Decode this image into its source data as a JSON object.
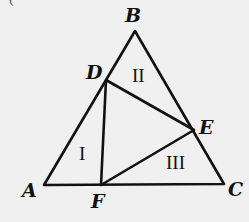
{
  "figure": {
    "partial_label": "(",
    "colors": {
      "background": "#f0f0f0",
      "stroke": "#111111"
    },
    "outer_triangle": {
      "vertices": [
        "A",
        "B",
        "C"
      ]
    },
    "inner_triangle": {
      "vertices": [
        "D",
        "E",
        "F"
      ]
    },
    "points": {
      "A": {
        "label": "A",
        "x": 44,
        "y": 185
      },
      "B": {
        "label": "B",
        "x": 135,
        "y": 31
      },
      "C": {
        "label": "C",
        "x": 224,
        "y": 184
      },
      "D": {
        "label": "D",
        "x": 106,
        "y": 80
      },
      "E": {
        "label": "E",
        "x": 194,
        "y": 130
      },
      "F": {
        "label": "F",
        "x": 101,
        "y": 185
      }
    },
    "regions": {
      "I": {
        "label": "I"
      },
      "II": {
        "label": "II"
      },
      "III": {
        "label": "III"
      }
    }
  }
}
